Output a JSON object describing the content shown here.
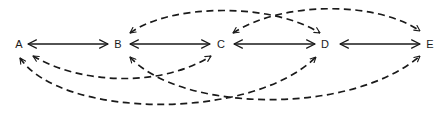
{
  "diagram": {
    "type": "directed-graph",
    "colors": {
      "stroke": "#1a1a1a",
      "background": "#ffffff"
    },
    "nodes": [
      {
        "id": "A",
        "label": "A",
        "x": 19,
        "y": 44
      },
      {
        "id": "B",
        "label": "B",
        "x": 118,
        "y": 44
      },
      {
        "id": "C",
        "label": "C",
        "x": 221,
        "y": 44
      },
      {
        "id": "D",
        "label": "D",
        "x": 325,
        "y": 44
      },
      {
        "id": "E",
        "label": "E",
        "x": 430,
        "y": 44
      }
    ],
    "solid_edges": [
      {
        "from": "A",
        "to": "B",
        "direction": "bidirectional"
      },
      {
        "from": "B",
        "to": "C",
        "direction": "bidirectional"
      },
      {
        "from": "C",
        "to": "D",
        "direction": "bidirectional"
      },
      {
        "from": "D",
        "to": "E",
        "direction": "bidirectional"
      }
    ],
    "dashed_edges": [
      {
        "from": "B",
        "to": "D",
        "direction": "bidirectional",
        "position": "above"
      },
      {
        "from": "C",
        "to": "E",
        "direction": "bidirectional",
        "position": "above"
      },
      {
        "from": "A",
        "to": "C",
        "direction": "bidirectional",
        "position": "below"
      },
      {
        "from": "A",
        "to": "D",
        "direction": "bidirectional",
        "position": "below"
      },
      {
        "from": "B",
        "to": "E",
        "direction": "bidirectional",
        "position": "below"
      }
    ]
  }
}
